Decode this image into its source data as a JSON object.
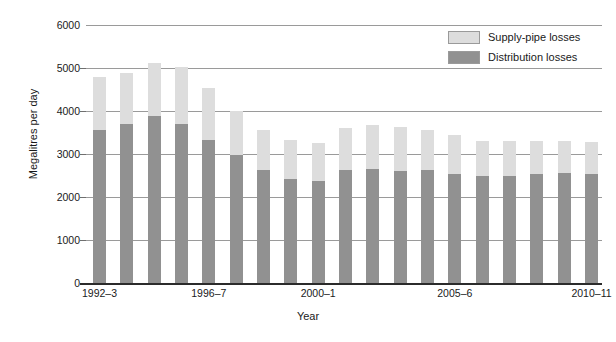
{
  "chart_data": {
    "type": "bar",
    "stacked": true,
    "title": "",
    "xlabel": "Year",
    "ylabel": "Megalitres per day",
    "ylim": [
      0,
      6000
    ],
    "ytick_labels": [
      "0",
      "1000",
      "2000",
      "3000",
      "4000",
      "5000",
      "6000"
    ],
    "ytick_values": [
      0,
      1000,
      2000,
      3000,
      4000,
      5000,
      6000
    ],
    "grid": "horizontal",
    "legend_position": "top-right",
    "categories": [
      "1992–3",
      "1993–4",
      "1994–5",
      "1995–6",
      "1996–7",
      "1997–8",
      "1998–9",
      "1999–2000",
      "2000–1",
      "2001–2",
      "2002–3",
      "2003–4",
      "2004–5",
      "2005–6",
      "2006–7",
      "2007–8",
      "2008–9",
      "2009–10",
      "2010–11"
    ],
    "xtick_labels": [
      {
        "label": "1992–3",
        "category_index": 0
      },
      {
        "label": "1996–7",
        "category_index": 4
      },
      {
        "label": "2000–1",
        "category_index": 8
      },
      {
        "label": "2005–6",
        "category_index": 13
      },
      {
        "label": "2010–11",
        "category_index": 18
      }
    ],
    "series": [
      {
        "name": "Distribution losses",
        "color": "#919191",
        "values": [
          3570,
          3700,
          3890,
          3700,
          3330,
          2970,
          2640,
          2430,
          2370,
          2620,
          2660,
          2600,
          2620,
          2530,
          2480,
          2500,
          2530,
          2550,
          2540
        ]
      },
      {
        "name": "Supply-pipe losses",
        "color": "#dddddd",
        "values": [
          1220,
          1190,
          1230,
          1330,
          1210,
          1030,
          920,
          890,
          890,
          990,
          1010,
          1020,
          930,
          910,
          820,
          810,
          770,
          750,
          740
        ]
      }
    ],
    "totals": [
      4790,
      4890,
      5120,
      5030,
      4540,
      4000,
      3560,
      3320,
      3260,
      3610,
      3670,
      3620,
      3550,
      3440,
      3300,
      3310,
      3300,
      3300,
      3280
    ]
  },
  "legend": {
    "items": [
      {
        "label": "Supply-pipe losses",
        "color": "#dddddd"
      },
      {
        "label": "Distribution losses",
        "color": "#919191"
      }
    ]
  },
  "axes": {
    "y_title": "Megalitres per day",
    "x_title": "Year"
  },
  "colors": {
    "supply_pipe": "#dddddd",
    "distribution": "#919191",
    "gridline": "#9a9a9a",
    "axis": "#2b2b2b",
    "background": "#ffffff"
  }
}
